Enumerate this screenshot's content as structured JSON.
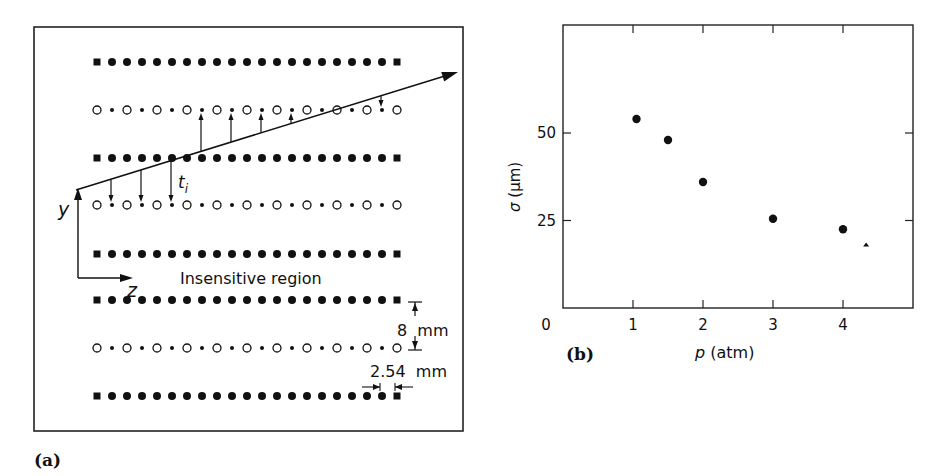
{
  "panel_a": {
    "label": "(a)",
    "axis_y": "y",
    "axis_z": "z",
    "track_label": "t",
    "track_label_sub": "i",
    "region_label": "Insensitive region",
    "dim_vertical": "8  mm",
    "dim_horizontal": "2.54  mm",
    "rows": [
      {
        "y": 62,
        "type": "cathode"
      },
      {
        "y": 110,
        "type": "anode"
      },
      {
        "y": 158,
        "type": "cathode"
      },
      {
        "y": 205,
        "type": "anode"
      },
      {
        "y": 254,
        "type": "cathode"
      },
      {
        "y": 300,
        "type": "cathode"
      },
      {
        "y": 348,
        "type": "anode"
      },
      {
        "y": 396,
        "type": "cathode"
      }
    ],
    "wires_per_row": 21,
    "wire_pitch_px": 15,
    "track": {
      "x1": 76,
      "y1": 190,
      "x2": 458,
      "y2": 72
    },
    "drift_arrows": [
      {
        "x": 111,
        "from_track": true,
        "to_row": 205
      },
      {
        "x": 141,
        "from_track": true,
        "to_row": 205
      },
      {
        "x": 171,
        "from_track": true,
        "to_row": 205
      },
      {
        "x": 201,
        "from_track": true,
        "to_row": 110
      },
      {
        "x": 231,
        "from_track": true,
        "to_row": 110
      },
      {
        "x": 261,
        "from_track": true,
        "to_row": 110
      },
      {
        "x": 291,
        "from_track": true,
        "to_row": 110
      },
      {
        "x": 381,
        "from_track": true,
        "to_row": 110
      }
    ]
  },
  "panel_b": {
    "label": "(b)"
  },
  "chart_data": {
    "type": "scatter",
    "title": "",
    "xlabel": "p (atm)",
    "ylabel": "σ (μm)",
    "xlim": [
      0,
      5
    ],
    "ylim": [
      0,
      80
    ],
    "xticks": [
      "0",
      "1",
      "2",
      "3",
      "4"
    ],
    "yticks": [
      "25",
      "50"
    ],
    "grid": false,
    "series": [
      {
        "name": "measured",
        "marker": "filled-circle",
        "x": [
          1.05,
          1.5,
          2.0,
          3.0,
          4.0
        ],
        "y": [
          54,
          48,
          36,
          25.5,
          22.5
        ]
      },
      {
        "name": "extra point",
        "marker": "small-triangle",
        "x": [
          4.33
        ],
        "y": [
          18
        ]
      }
    ]
  }
}
